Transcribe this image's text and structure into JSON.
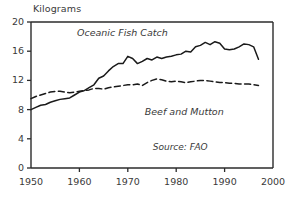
{
  "chart_data": {
    "type": "line",
    "title": "",
    "xlabel": "",
    "ylabel": "Kilograms",
    "xlim": [
      1950,
      2000
    ],
    "ylim": [
      0,
      20
    ],
    "xticks": [
      1950,
      1960,
      1970,
      1980,
      1990,
      2000
    ],
    "yticks": [
      0,
      4,
      8,
      12,
      16,
      20
    ],
    "grid": false,
    "legend_position": "inline-annotation",
    "annotations": [
      "Source: FAO"
    ],
    "series": [
      {
        "name": "Oceanic Fish Catch",
        "style": "solid",
        "color": "#1a1a1a",
        "x": [
          1950,
          1951,
          1952,
          1953,
          1954,
          1955,
          1956,
          1957,
          1958,
          1959,
          1960,
          1961,
          1962,
          1963,
          1964,
          1965,
          1966,
          1967,
          1968,
          1969,
          1970,
          1971,
          1972,
          1973,
          1974,
          1975,
          1976,
          1977,
          1978,
          1979,
          1980,
          1981,
          1982,
          1983,
          1984,
          1985,
          1986,
          1987,
          1988,
          1989,
          1990,
          1991,
          1992,
          1993,
          1994,
          1995,
          1996,
          1997
        ],
        "values": [
          8.0,
          8.3,
          8.6,
          8.7,
          9.0,
          9.2,
          9.4,
          9.5,
          9.6,
          10.0,
          10.4,
          10.6,
          11.0,
          11.4,
          12.3,
          12.6,
          13.3,
          13.9,
          14.3,
          14.3,
          15.3,
          15.0,
          14.3,
          14.6,
          15.0,
          14.8,
          15.2,
          15.0,
          15.2,
          15.3,
          15.5,
          15.6,
          16.0,
          15.9,
          16.6,
          16.8,
          17.2,
          16.9,
          17.3,
          17.1,
          16.3,
          16.2,
          16.3,
          16.6,
          17.0,
          16.9,
          16.6,
          14.9
        ]
      },
      {
        "name": "Beef and Mutton",
        "style": "dashed",
        "color": "#1a1a1a",
        "x": [
          1950,
          1951,
          1952,
          1953,
          1954,
          1955,
          1956,
          1957,
          1958,
          1959,
          1960,
          1961,
          1962,
          1963,
          1964,
          1965,
          1966,
          1967,
          1968,
          1969,
          1970,
          1971,
          1972,
          1973,
          1974,
          1975,
          1976,
          1977,
          1978,
          1979,
          1980,
          1981,
          1982,
          1983,
          1984,
          1985,
          1986,
          1987,
          1988,
          1989,
          1990,
          1991,
          1992,
          1993,
          1994,
          1995,
          1996,
          1997
        ],
        "values": [
          9.5,
          9.8,
          10.0,
          10.2,
          10.4,
          10.5,
          10.5,
          10.4,
          10.3,
          10.4,
          10.5,
          10.6,
          10.7,
          10.9,
          10.9,
          10.8,
          11.0,
          11.1,
          11.2,
          11.3,
          11.4,
          11.4,
          11.5,
          11.3,
          11.7,
          12.0,
          12.2,
          12.1,
          11.9,
          11.8,
          11.9,
          11.8,
          11.7,
          11.8,
          11.9,
          12.0,
          12.0,
          11.9,
          11.8,
          11.7,
          11.7,
          11.6,
          11.6,
          11.5,
          11.5,
          11.5,
          11.4,
          11.3
        ]
      }
    ],
    "series_label_positions": [
      {
        "name": "Oceanic Fish Catch",
        "x": 1959.5,
        "y": 18.3
      },
      {
        "name": "Beef and Mutton",
        "x": 1973.5,
        "y": 7.5
      }
    ],
    "source_position": {
      "x": 1986.5,
      "y": 2.6
    }
  }
}
